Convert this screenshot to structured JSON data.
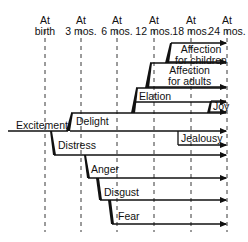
{
  "diagram": {
    "timeline_headers": [
      {
        "line1": "At",
        "line2": "birth"
      },
      {
        "line1": "At",
        "line2": "3 mos."
      },
      {
        "line1": "At",
        "line2": "6 mos."
      },
      {
        "line1": "At",
        "line2": "12 mos."
      },
      {
        "line1": "At",
        "line2": "18 mos."
      },
      {
        "line1": "At",
        "line2": "24 mos."
      }
    ],
    "emotions": {
      "excitement": "Excitement",
      "delight": "Delight",
      "distress": "Distress",
      "elation": "Elation",
      "affection_adults_1": "Affection",
      "affection_adults_2": "for adults",
      "affection_children_1": "Affection",
      "affection_children_2": "for children",
      "joy": "Joy",
      "jealousy": "Jealousy",
      "anger": "Anger",
      "disgust": "Disgust",
      "fear": "Fear"
    }
  }
}
